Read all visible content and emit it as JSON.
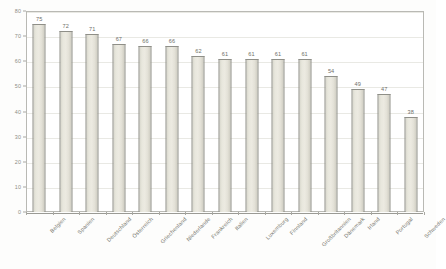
{
  "chart_data": {
    "type": "bar",
    "title": "",
    "subtitle": "",
    "xlabel": "",
    "ylabel": "",
    "ylim": [
      0,
      80
    ],
    "ytick_step": 10,
    "yticks": [
      "0",
      "10",
      "20",
      "30",
      "40",
      "50",
      "60",
      "70",
      "80"
    ],
    "grid": true,
    "legend": false,
    "orientation": "vertical",
    "categories": [
      "Belgien",
      "Spanien",
      "Deutschland",
      "Österreich",
      "Griechenland",
      "Niederlande",
      "Frankreich",
      "Italien",
      "Luxemburg",
      "Finnland",
      "Großbritannien",
      "Dänemark",
      "Irland",
      "Portugal",
      "Schweden"
    ],
    "values": [
      75,
      72,
      71,
      67,
      66,
      66,
      62,
      61,
      61,
      61,
      61,
      54,
      49,
      47,
      38
    ],
    "value_labels": [
      "75",
      "72",
      "71",
      "67",
      "66",
      "66",
      "62",
      "61",
      "61",
      "61",
      "61",
      "54",
      "49",
      "47",
      "38"
    ]
  },
  "style": {
    "bar_fill": "#eceae1",
    "bar_border": "#8f8f88",
    "grid_color": "#e9e9e4",
    "axis_color": "#a8a8a2",
    "text_color": "#78786f",
    "plot_background": "#ffffff",
    "page_background": "#fdfdfc"
  }
}
